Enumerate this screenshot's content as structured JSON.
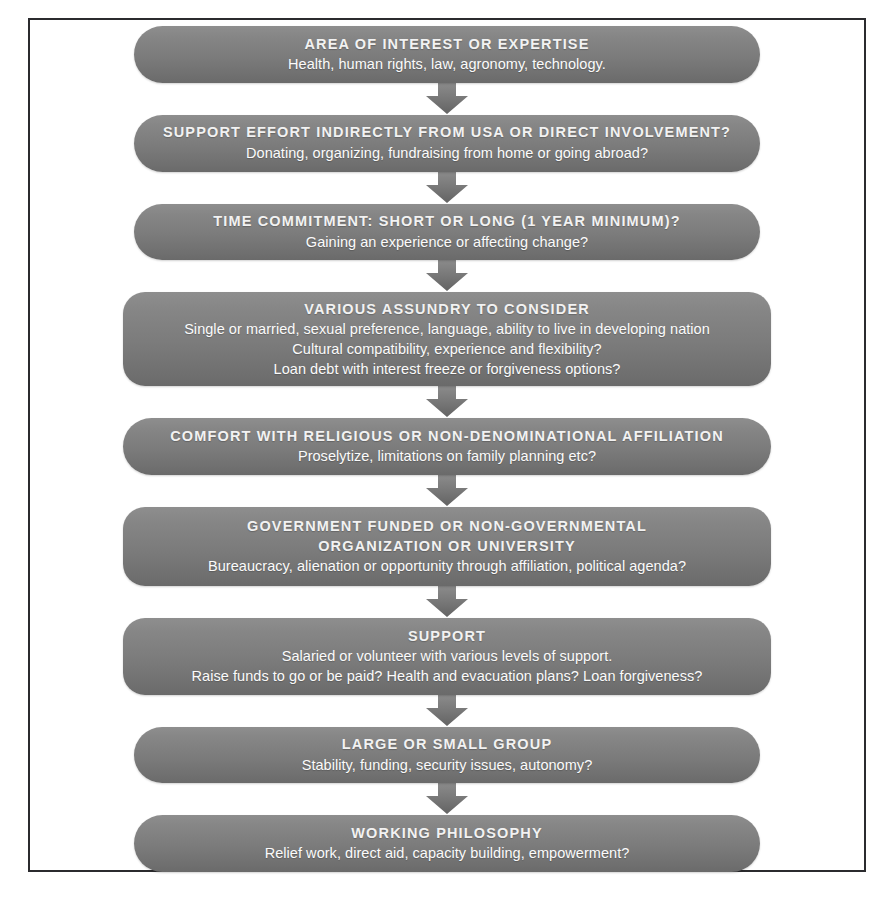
{
  "page": {
    "background_color": "#ffffff",
    "frame_border_color": "#2b2b2e",
    "node_gradient_top": "#8e8e8e",
    "node_gradient_bottom": "#6a6a6a",
    "node_text_color": "#ffffff",
    "arrow_color": "#6f6f6f",
    "caption_sliver": "figure caption cropped at top edge"
  },
  "flow": {
    "type": "vertical-flowchart",
    "connector": "down-block-arrow",
    "connector_count": 8,
    "nodes": [
      {
        "id": "area-of-interest",
        "shape": "pill",
        "title": "AREA OF INTEREST OR EXPERTISE",
        "lines": [
          "Health, human rights, law, agronomy, technology."
        ]
      },
      {
        "id": "support-effort",
        "shape": "pill",
        "title": "SUPPORT EFFORT INDIRECTLY FROM USA OR DIRECT INVOLVEMENT?",
        "lines": [
          "Donating, organizing, fundraising from home or going abroad?"
        ]
      },
      {
        "id": "time-commitment",
        "shape": "pill",
        "title": "TIME COMMITMENT: SHORT OR LONG (1 YEAR MINIMUM)?",
        "lines": [
          "Gaining an experience or affecting change?"
        ]
      },
      {
        "id": "various-assundry",
        "shape": "rounded",
        "title": "VARIOUS ASSUNDRY TO CONSIDER",
        "lines": [
          "Single or married, sexual preference, language, ability to live in developing nation",
          "Cultural compatibility, experience and flexibility?",
          "Loan debt with interest freeze or forgiveness options?"
        ]
      },
      {
        "id": "religious-affiliation",
        "shape": "pill",
        "title": "COMFORT WITH RELIGIOUS OR NON-DENOMINATIONAL AFFILIATION",
        "lines": [
          "Proselytize, limitations on family planning etc?"
        ]
      },
      {
        "id": "funding-source",
        "shape": "rounded",
        "title": "GOVERNMENT FUNDED OR NON-GOVERNMENTAL",
        "title2": "ORGANIZATION OR UNIVERSITY",
        "lines": [
          "Bureaucracy, alienation or opportunity through affiliation, political agenda?"
        ]
      },
      {
        "id": "support",
        "shape": "rounded",
        "title": "SUPPORT",
        "lines": [
          "Salaried or volunteer with various levels of support.",
          "Raise funds to go or be paid? Health and evacuation plans? Loan forgiveness?"
        ]
      },
      {
        "id": "group-size",
        "shape": "pill",
        "title": "LARGE OR SMALL GROUP",
        "lines": [
          "Stability, funding, security issues, autonomy?"
        ]
      },
      {
        "id": "working-philosophy",
        "shape": "pill",
        "title": "WORKING PHILOSOPHY",
        "lines": [
          "Relief work, direct aid, capacity building, empowerment?"
        ]
      }
    ]
  }
}
